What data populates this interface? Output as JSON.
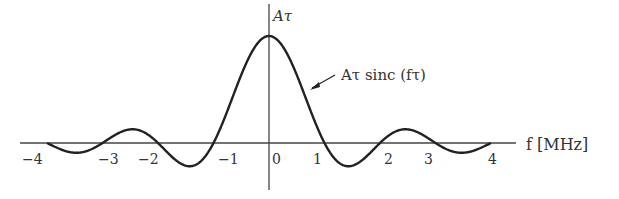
{
  "chart_data": {
    "type": "line",
    "title": "",
    "function_label": "Aτ sinc (fτ)",
    "peak_label": "Aτ",
    "xlabel": "f [MHz]",
    "ylabel": "",
    "x_ticks": [
      "−4",
      "−3",
      "−2",
      "−1",
      "0",
      "1",
      "2",
      "3",
      "4"
    ],
    "x_tick_values": [
      -4,
      -3,
      -2,
      -1,
      0,
      1,
      2,
      3,
      4
    ],
    "xlim": [
      -4,
      4
    ],
    "zero_crossings": [
      -4,
      -3,
      -2,
      -1,
      1,
      2,
      3,
      4
    ],
    "peak": {
      "x": 0,
      "y": 1
    },
    "grid": false,
    "legend": "none"
  },
  "labels": {
    "peak": "Aτ",
    "curve": "Aτ sinc (fτ)",
    "x_axis": "f [MHz]",
    "ticks": [
      "−4",
      "−3",
      "−2",
      "−1",
      "0",
      "1",
      "2",
      "3",
      "4"
    ]
  }
}
